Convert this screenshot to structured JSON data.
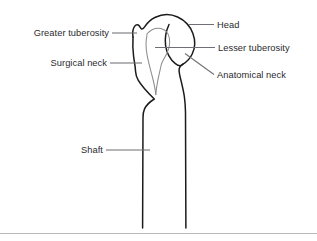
{
  "figure": {
    "name": "Proximal humerus anatomical line diagram",
    "background_color": "#ffffff",
    "outline_color": "#1b1b1b",
    "inner_line_color": "#8d8d92",
    "leader_color": "#6f6f75",
    "text_color": "#2a2a2e",
    "rule_color": "#b9b9bd"
  },
  "labels": {
    "head": "Head",
    "lesser_tuberosity": "Lesser tuberosity",
    "anatomical_neck": "Anatomical neck",
    "greater_tuberosity": "Greater tuberosity",
    "surgical_neck": "Surgical neck",
    "shaft": "Shaft"
  }
}
